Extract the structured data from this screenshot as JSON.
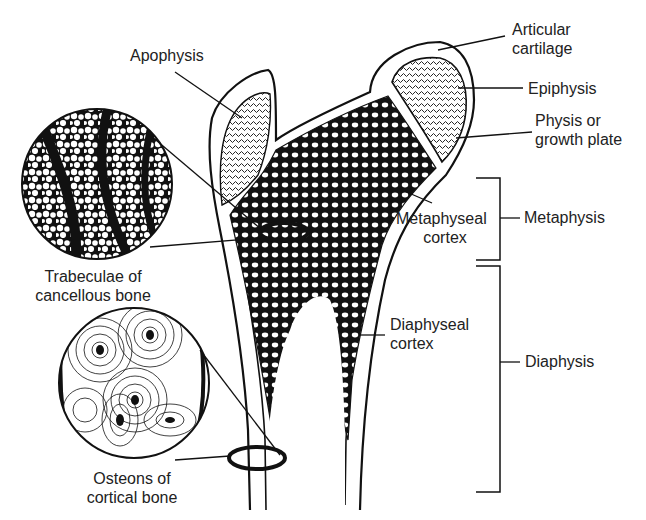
{
  "diagram": {
    "colors": {
      "ink": "#111111",
      "background": "#ffffff",
      "label_text": "#222222"
    },
    "labels": {
      "apophysis": "Apophysis",
      "articular_cartilage_1": "Articular",
      "articular_cartilage_2": "cartilage",
      "epiphysis": "Epiphysis",
      "physis_1": "Physis or",
      "physis_2": "growth plate",
      "metaphyseal_cortex_1": "Metaphyseal",
      "metaphyseal_cortex_2": "cortex",
      "metaphysis": "Metaphysis",
      "diaphyseal_cortex_1": "Diaphyseal",
      "diaphyseal_cortex_2": "cortex",
      "diaphysis": "Diaphysis",
      "trabeculae_1": "Trabeculae of",
      "trabeculae_2": "cancellous bone",
      "osteons_1": "Osteons of",
      "osteons_2": "cortical bone"
    },
    "insets": [
      {
        "name": "trabeculae-inset",
        "depicts": "cancellous bone trabeculae"
      },
      {
        "name": "osteons-inset",
        "depicts": "osteons of cortical bone"
      }
    ]
  }
}
